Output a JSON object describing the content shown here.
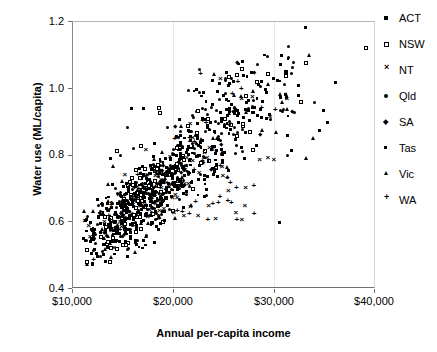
{
  "chart_data": {
    "type": "scatter",
    "title": "",
    "xlabel": "Annual per-capita income",
    "ylabel": "Water use (ML/capita)",
    "xlim": [
      10000,
      40000
    ],
    "ylim": [
      0.4,
      1.2
    ],
    "xticks": [
      "$10,000",
      "$20,000",
      "$30,000",
      "$40,000"
    ],
    "xtick_values": [
      10000,
      20000,
      30000,
      40000
    ],
    "yticks": [
      "0.4",
      "0.6",
      "0.8",
      "1.0",
      "1.2"
    ],
    "ytick_values": [
      0.4,
      0.6,
      0.8,
      1.0,
      1.2
    ],
    "grid": "vertical-light",
    "legend_position": "right",
    "series": [
      {
        "name": "ACT",
        "marker": "filled-square"
      },
      {
        "name": "NSW",
        "marker": "open-square"
      },
      {
        "name": "NT",
        "marker": "x"
      },
      {
        "name": "Qld",
        "marker": "filled-circle"
      },
      {
        "name": "SA",
        "marker": "diamond"
      },
      {
        "name": "Tas",
        "marker": "small-filled-square"
      },
      {
        "name": "Vic",
        "marker": "filled-triangle"
      },
      {
        "name": "WA",
        "marker": "plus"
      }
    ]
  },
  "axes": {
    "y_title": "Water use (ML/capita)",
    "x_title": "Annual per-capita income",
    "y_ticks": [
      "1.2",
      "1.0",
      "0.8",
      "0.6",
      "0.4"
    ],
    "x_ticks": [
      "$10,000",
      "$20,000",
      "$30,000",
      "$40,000"
    ]
  },
  "legend": {
    "items": [
      {
        "label": "ACT"
      },
      {
        "label": "NSW"
      },
      {
        "label": "NT"
      },
      {
        "label": "Qld"
      },
      {
        "label": "SA"
      },
      {
        "label": "Tas"
      },
      {
        "label": "Vic"
      },
      {
        "label": "WA"
      }
    ]
  },
  "colors": {
    "marker": "#000000",
    "axis": "#6f6f6f",
    "grid": "#e8e8e8",
    "background": "#ffffff"
  }
}
